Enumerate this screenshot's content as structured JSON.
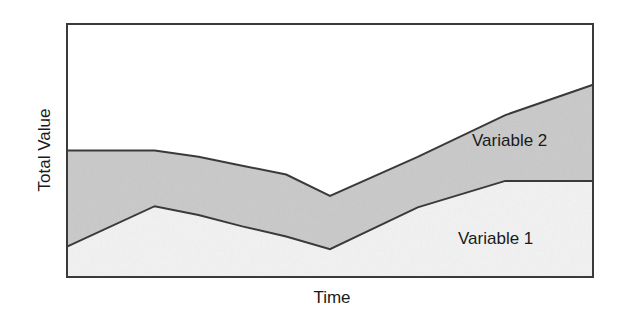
{
  "chart_data": {
    "type": "area",
    "stacked": true,
    "title": "",
    "xlabel": "Time",
    "ylabel": "Total Value",
    "grid": false,
    "ticks": false,
    "legend": "inline labels",
    "x": [
      0,
      1,
      1.5,
      2,
      2.5,
      3,
      4,
      5,
      6
    ],
    "xlim": [
      0,
      6
    ],
    "ylim": [
      0,
      100
    ],
    "series": [
      {
        "name": "Variable 1",
        "color": "#f4f4f4",
        "values": [
          12,
          28,
          24.5,
          20,
          16,
          11,
          27.5,
          38,
          38
        ]
      },
      {
        "name": "Variable 2",
        "color": "#cccccc",
        "values": [
          38,
          22,
          23,
          24,
          24.5,
          21,
          20,
          26,
          38
        ]
      }
    ],
    "totals": [
      50,
      50,
      47.5,
      44,
      40.5,
      32,
      47.5,
      64,
      76
    ],
    "annotations": [
      {
        "text": "Variable 2",
        "near_x": 5.2
      },
      {
        "text": "Variable 1",
        "near_x": 5.2
      }
    ]
  },
  "labels": {
    "xlabel": "Time",
    "ylabel": "Total Value",
    "series1": "Variable 1",
    "series2": "Variable 2"
  }
}
